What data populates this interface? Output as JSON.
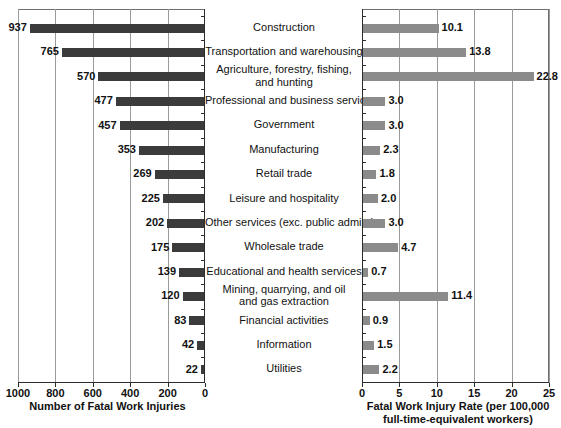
{
  "chart_data": {
    "type": "bar",
    "title": "",
    "orientation": "horizontal",
    "grid": true,
    "legend": "none",
    "categories": [
      "Construction",
      "Transportation and warehousing",
      "Agriculture, forestry, fishing, and hunting",
      "Professional and business services",
      "Government",
      "Manufacturing",
      "Retail trade",
      "Leisure and hospitality",
      "Other services (exc. public admin.)",
      "Wholesale trade",
      "Educational and health services",
      "Mining, quarrying, and oil and gas extraction",
      "Financial activities",
      "Information",
      "Utilities"
    ],
    "category_lines": [
      [
        "Construction"
      ],
      [
        "Transportation and warehousing"
      ],
      [
        "Agriculture, forestry, fishing,",
        "and hunting"
      ],
      [
        "Professional and business services"
      ],
      [
        "Government"
      ],
      [
        "Manufacturing"
      ],
      [
        "Retail trade"
      ],
      [
        "Leisure and hospitality"
      ],
      [
        "Other services (exc. public admin.)"
      ],
      [
        "Wholesale trade"
      ],
      [
        "Educational and health services"
      ],
      [
        "Mining, quarrying, and oil",
        "and gas extraction"
      ],
      [
        "Financial activities"
      ],
      [
        "Information"
      ],
      [
        "Utilities"
      ]
    ],
    "panels": [
      {
        "id": "counts",
        "xlabel_lines": [
          "Number of Fatal Work Injuries"
        ],
        "direction": "rtl",
        "xlim": [
          0,
          1000
        ],
        "ticks": [
          1000,
          800,
          600,
          400,
          200,
          0
        ],
        "tick_labels": [
          "1000",
          "800",
          "600",
          "400",
          "200",
          "0"
        ],
        "bar_color": "#3b3b3b",
        "values": [
          937,
          765,
          570,
          477,
          457,
          353,
          269,
          225,
          202,
          175,
          139,
          120,
          83,
          42,
          22
        ],
        "value_labels": [
          "937",
          "765",
          "570",
          "477",
          "457",
          "353",
          "269",
          "225",
          "202",
          "175",
          "139",
          "120",
          "83",
          "42",
          "22"
        ]
      },
      {
        "id": "rates",
        "xlabel_lines": [
          "Fatal Work Injury Rate (per 100,000",
          "full-time-equivalent workers)"
        ],
        "direction": "ltr",
        "xlim": [
          0,
          25
        ],
        "ticks": [
          0,
          5,
          10,
          15,
          20,
          25
        ],
        "tick_labels": [
          "0",
          "5",
          "10",
          "15",
          "20",
          "25"
        ],
        "bar_color": "#8b8b8b",
        "values": [
          10.1,
          13.8,
          22.8,
          3.0,
          3.0,
          2.3,
          1.8,
          2.0,
          3.0,
          4.7,
          0.7,
          11.4,
          0.9,
          1.5,
          2.2
        ],
        "value_labels": [
          "10.1",
          "13.8",
          "22.8",
          "3.0",
          "3.0",
          "2.3",
          "1.8",
          "2.0",
          "3.0",
          "4.7",
          "0.7",
          "11.4",
          "0.9",
          "1.5",
          "2.2"
        ]
      }
    ]
  }
}
